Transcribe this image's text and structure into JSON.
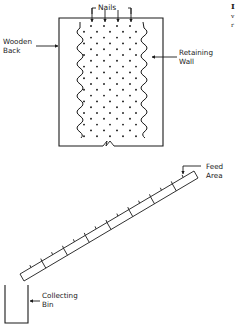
{
  "figure": {
    "top_panel": {
      "labels": {
        "nails": "Nails",
        "wooden_back_line1": "Wooden",
        "wooden_back_line2": "Back",
        "retaining_wall_line1": "Retaining",
        "retaining_wall_line2": "Wall"
      },
      "nail_arrow_count": 4,
      "dot_grid": {
        "rows": 20,
        "staggered": true
      }
    },
    "bottom_panel": {
      "labels": {
        "feed_area_line1": "Feed",
        "feed_area_line2": "Area",
        "collecting_bin_line1": "Collecting",
        "collecting_bin_line2": "Bin"
      },
      "ramp_rung_count": 10
    },
    "edge_text": {
      "line1": "I",
      "line2": "v",
      "line3": "r"
    },
    "colors": {
      "ink": "#1a1a1a",
      "background": "#ffffff"
    }
  }
}
